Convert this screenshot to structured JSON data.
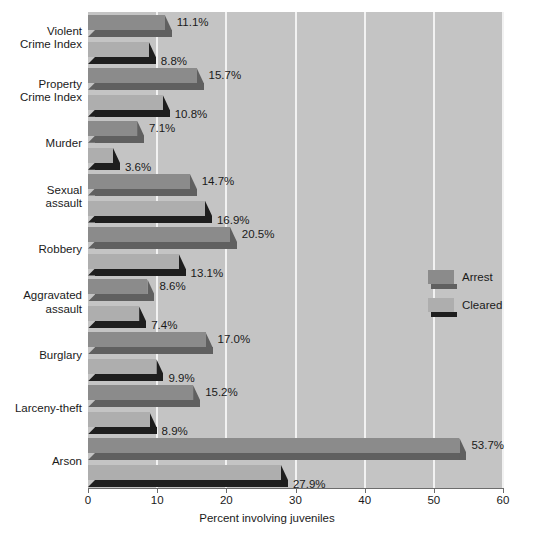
{
  "chart_data": {
    "type": "bar",
    "orientation": "horizontal",
    "title": "",
    "xlabel": "Percent involving juveniles",
    "ylabel": "",
    "xlim": [
      0,
      60
    ],
    "xticks": [
      "0",
      "10",
      "20",
      "30",
      "40",
      "50",
      "60"
    ],
    "grid": "vertical white gridlines at 10, 20, 30, 40, 50, 60",
    "legend_position": "right-middle",
    "categories": [
      "Violent\nCrime Index",
      "Property\nCrime Index",
      "Murder",
      "Sexual\nassault",
      "Robbery",
      "Aggravated\nassault",
      "Burglary",
      "Larceny-theft",
      "Arson"
    ],
    "series": [
      {
        "name": "Arrest",
        "color": "#8b8b8b",
        "values": [
          11.1,
          15.7,
          7.1,
          14.7,
          20.5,
          8.6,
          17.0,
          15.2,
          53.7
        ],
        "labels": [
          "11.1%",
          "15.7%",
          "7.1%",
          "14.7%",
          "20.5%",
          "8.6%",
          "17.0%",
          "15.2%",
          "53.7%"
        ]
      },
      {
        "name": "Cleared",
        "color": "#aeaeae",
        "values": [
          8.8,
          10.8,
          3.6,
          16.9,
          13.1,
          7.4,
          9.9,
          8.9,
          27.9
        ],
        "labels": [
          "8.8%",
          "10.8%",
          "3.6%",
          "16.9%",
          "13.1%",
          "7.4%",
          "9.9%",
          "8.9%",
          "27.9%"
        ]
      }
    ]
  },
  "legend": {
    "items": [
      {
        "label": "Arrest",
        "color": "#8b8b8b",
        "shadow": "#606060"
      },
      {
        "label": "Cleared",
        "color": "#aeaeae",
        "shadow": "#1e1e1e"
      }
    ]
  },
  "axis": {
    "x_title": "Percent involving juveniles",
    "tick_labels": [
      "0",
      "10",
      "20",
      "30",
      "40",
      "50",
      "60"
    ]
  },
  "colors": {
    "plot_background": "#c4c4c4",
    "page_background": "#ffffff",
    "gridline": "#f2f2f2",
    "arrest_face": "#8b8b8b",
    "arrest_shadow": "#606060",
    "cleared_face": "#aeaeae",
    "cleared_shadow": "#1e1e1e",
    "text": "#1a1a1a"
  }
}
